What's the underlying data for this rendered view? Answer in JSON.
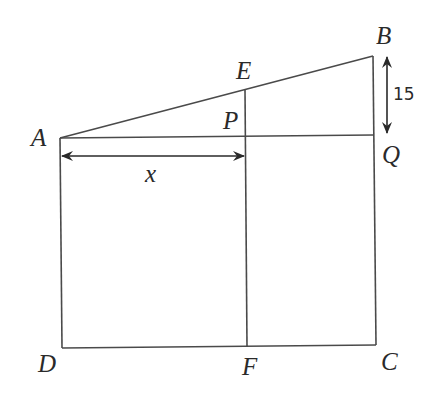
{
  "diagram": {
    "points": {
      "A": {
        "label": "A",
        "x": 60,
        "y": 138
      },
      "E": {
        "label": "E",
        "x": 245,
        "y": 90
      },
      "P": {
        "label": "P",
        "x": 245,
        "y": 136
      },
      "B": {
        "label": "B",
        "x": 373,
        "y": 56
      },
      "Q": {
        "label": "Q",
        "x": 373,
        "y": 135
      },
      "D": {
        "label": "D",
        "x": 62,
        "y": 348
      },
      "F": {
        "label": "F",
        "x": 247,
        "y": 347
      },
      "C": {
        "label": "C",
        "x": 376,
        "y": 345
      }
    },
    "segments": [
      "AB",
      "AQ",
      "AD",
      "EF",
      "BC",
      "DC"
    ],
    "dimensions": {
      "x_label": "x",
      "bq_label": "15"
    },
    "line_color": "#4a4a4a",
    "text_color": "#2a2a2a"
  }
}
